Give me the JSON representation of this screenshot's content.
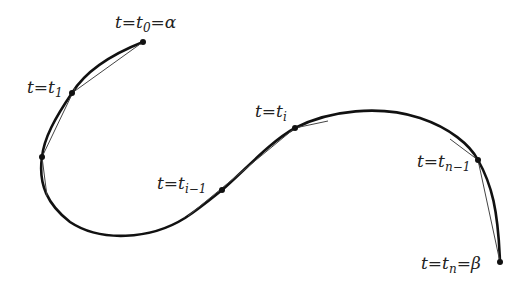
{
  "diagram": {
    "labels": {
      "t0": {
        "var": "t",
        "eq": "=",
        "sym": "t",
        "sub": "0",
        "tail": "=α"
      },
      "t1": {
        "var": "t",
        "eq": "=",
        "sym": "t",
        "sub": "1",
        "tail": ""
      },
      "ti_minus_1": {
        "var": "t",
        "eq": "=",
        "sym": "t",
        "sub": "i−1",
        "tail": ""
      },
      "ti": {
        "var": "t",
        "eq": "=",
        "sym": "t",
        "sub": "i",
        "tail": ""
      },
      "tn_minus_1": {
        "var": "t",
        "eq": "=",
        "sym": "t",
        "sub": "n−1",
        "tail": ""
      },
      "tn": {
        "var": "t",
        "eq": "=",
        "sym": "t",
        "sub": "n",
        "tail": "=β"
      }
    },
    "points": [
      {
        "name": "t0",
        "x": 143,
        "y": 42
      },
      {
        "name": "t1",
        "x": 72,
        "y": 93
      },
      {
        "name": "t2",
        "x": 42,
        "y": 157
      },
      {
        "name": "ti_minus_1",
        "x": 222,
        "y": 190
      },
      {
        "name": "ti",
        "x": 295,
        "y": 128
      },
      {
        "name": "tn_minus_1",
        "x": 478,
        "y": 160
      },
      {
        "name": "tn",
        "x": 500,
        "y": 262
      }
    ],
    "colors": {
      "curve": "#111111",
      "segment": "#444444",
      "text": "#222222"
    }
  }
}
